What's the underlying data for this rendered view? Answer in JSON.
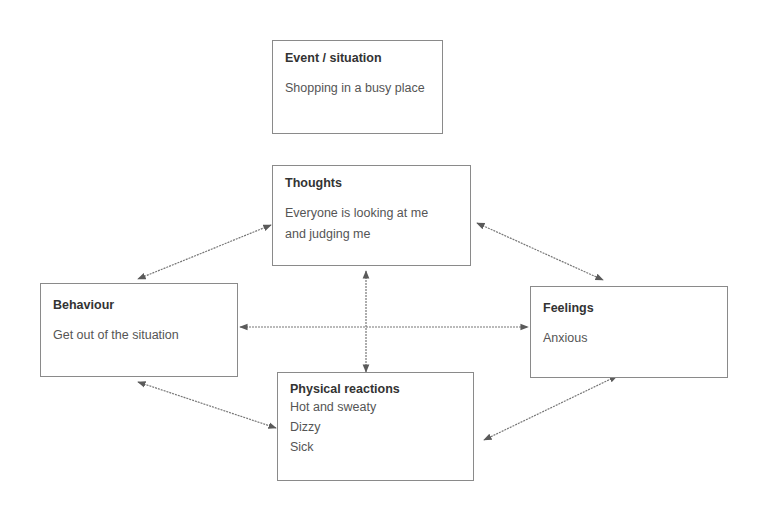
{
  "diagram": {
    "type": "cbt-cycle",
    "boxes": {
      "event": {
        "title": "Event / situation",
        "lines": [
          "Shopping in a busy place"
        ]
      },
      "thoughts": {
        "title": "Thoughts",
        "lines": [
          "Everyone is looking at me",
          "and judging me"
        ]
      },
      "behaviour": {
        "title": "Behaviour",
        "lines": [
          "Get out of the situation"
        ]
      },
      "feelings": {
        "title": "Feelings",
        "lines": [
          "Anxious"
        ]
      },
      "physical": {
        "title": "Physical reactions",
        "lines": [
          "Hot and sweaty",
          "Dizzy",
          "Sick"
        ]
      }
    },
    "connections": [
      {
        "from": "thoughts",
        "to": "behaviour",
        "type": "bidirectional"
      },
      {
        "from": "thoughts",
        "to": "feelings",
        "type": "bidirectional"
      },
      {
        "from": "thoughts",
        "to": "physical",
        "type": "bidirectional"
      },
      {
        "from": "behaviour",
        "to": "feelings",
        "type": "bidirectional"
      },
      {
        "from": "behaviour",
        "to": "physical",
        "type": "bidirectional"
      },
      {
        "from": "feelings",
        "to": "physical",
        "type": "bidirectional"
      }
    ],
    "colors": {
      "border": "#8a8a8a",
      "arrow": "#666666",
      "title_text": "#333333",
      "body_text": "#555555"
    }
  }
}
